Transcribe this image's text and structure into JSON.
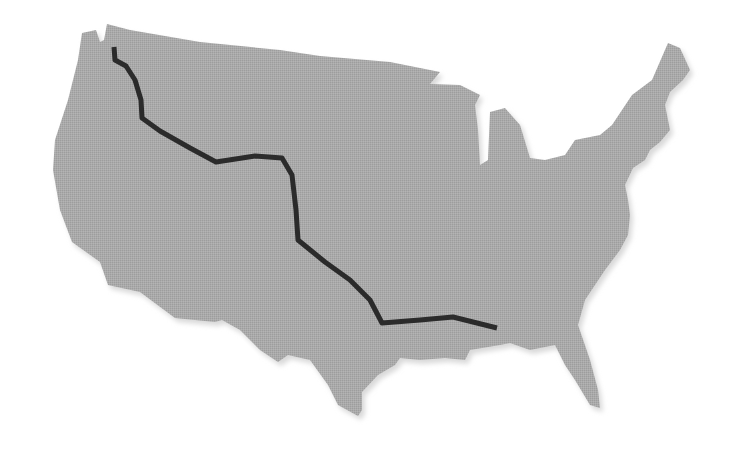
{
  "map": {
    "title": "Route across the contiguous United States",
    "land_color": "#a9a9a9",
    "land_shadow": "#d6d6d6",
    "route_color": "#2b2b2b",
    "background": "#ffffff"
  },
  "route": {
    "label": "route-path",
    "points": [
      [
        114,
        47
      ],
      [
        115,
        60
      ],
      [
        126,
        66
      ],
      [
        135,
        80
      ],
      [
        141,
        100
      ],
      [
        142,
        118
      ],
      [
        160,
        131
      ],
      [
        190,
        148
      ],
      [
        216,
        162
      ],
      [
        255,
        156
      ],
      [
        282,
        158
      ],
      [
        292,
        175
      ],
      [
        296,
        210
      ],
      [
        298,
        240
      ],
      [
        325,
        262
      ],
      [
        350,
        280
      ],
      [
        370,
        300
      ],
      [
        382,
        323
      ],
      [
        420,
        320
      ],
      [
        453,
        317
      ],
      [
        497,
        328
      ]
    ]
  }
}
